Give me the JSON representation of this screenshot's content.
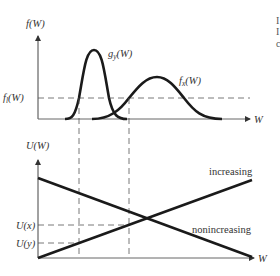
{
  "top_panel": {
    "y_axis_label": "f(W)",
    "x_axis_label": "W",
    "threshold_label_main": "f",
    "threshold_label_sub": "l",
    "threshold_label_tail": "(W)",
    "curve_g": {
      "label_main": "g",
      "label_sub": "y",
      "label_tail": "(W)"
    },
    "curve_f": {
      "label_main": "f",
      "label_sub": "x",
      "label_tail": "(W)"
    }
  },
  "bottom_panel": {
    "y_axis_label": "U(W)",
    "x_axis_label": "W",
    "tick_ux": "U(x)",
    "tick_uy": "U(y)",
    "line_increasing": "increasing",
    "line_nonincreasing": "nonincreasing"
  },
  "cropped_edge_text": [
    "I",
    "I",
    "c"
  ],
  "colors": {
    "curve": "#1a1a1a",
    "axis": "#444444",
    "dash": "#555555",
    "text": "#333333"
  }
}
